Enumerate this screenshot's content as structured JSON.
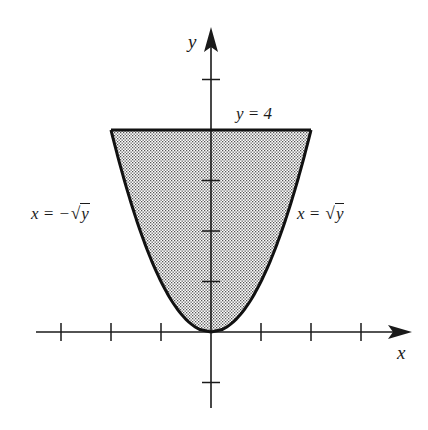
{
  "figure": {
    "axes": {
      "x_label": "x",
      "y_label": "y",
      "x_ticks": [
        -3,
        -2,
        -1,
        1,
        2,
        3
      ],
      "y_ticks": [
        -1,
        1,
        2,
        3,
        4,
        5
      ]
    },
    "labels": {
      "top_line": "y = 4",
      "left_curve_prefix": "x = −",
      "right_curve_prefix": "x = ",
      "sqrt_symbol": "√",
      "radicand": "y"
    },
    "colors": {
      "ink": "#1a1a1a",
      "shade": "#b8b8b8",
      "background": "#ffffff"
    },
    "region": {
      "bounds": [
        "x = -sqrt(y)",
        "x = sqrt(y)",
        "y = 4"
      ],
      "shading": "stippled"
    }
  },
  "chart_data": {
    "type": "area",
    "title": "",
    "xlabel": "x",
    "ylabel": "y",
    "xlim": [
      -3.5,
      4
    ],
    "ylim": [
      -1.5,
      6
    ],
    "x_ticks": [
      -3,
      -2,
      -1,
      1,
      2,
      3
    ],
    "y_ticks": [
      -1,
      1,
      2,
      3,
      4,
      5
    ],
    "curves": [
      {
        "name": "x = -√y",
        "equation": "x = -sqrt(y)",
        "y_range": [
          0,
          4
        ]
      },
      {
        "name": "x = √y",
        "equation": "x = sqrt(y)",
        "y_range": [
          0,
          4
        ]
      },
      {
        "name": "y = 4",
        "equation": "y = 4",
        "x_range": [
          -2,
          2
        ]
      }
    ],
    "shaded_region": "between x = -sqrt(y) and x = sqrt(y), 0 <= y <= 4",
    "grid": false,
    "legend": "none"
  }
}
